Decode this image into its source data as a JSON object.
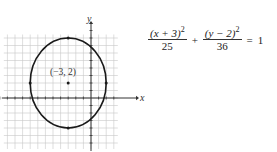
{
  "chart_data": {
    "type": "line",
    "title": "",
    "xlabel": "x",
    "ylabel": "y",
    "xlim": [
      -12,
      3
    ],
    "ylim": [
      -6,
      9
    ],
    "grid": true,
    "series": [
      {
        "name": "ellipse",
        "shape": "ellipse",
        "center": [
          -3,
          2
        ],
        "a_x": 5,
        "b_y": 6,
        "vertices": [
          [
            -3,
            8
          ],
          [
            -3,
            -4
          ],
          [
            -8,
            2
          ],
          [
            2,
            2
          ]
        ]
      }
    ],
    "points": [
      {
        "x": -3,
        "y": 2,
        "label": "(−3, 2)"
      }
    ],
    "annotations": [
      "(−3, 2)"
    ]
  },
  "equation": {
    "term1_num": "(x + 3)",
    "term1_exp": "2",
    "term1_den": "25",
    "plus": "+",
    "term2_num": "(y − 2)",
    "term2_exp": "2",
    "term2_den": "36",
    "equals": "=",
    "rhs": "1"
  },
  "colors": {
    "grid": "#c8c8c8",
    "axis": "#333333",
    "curve": "#1a1a1a"
  }
}
